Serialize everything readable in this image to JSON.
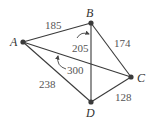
{
  "diagram": {
    "type": "weighted-graph",
    "vertices": [
      {
        "id": "A",
        "label": "A",
        "x": 23,
        "y": 42
      },
      {
        "id": "B",
        "label": "B",
        "x": 91,
        "y": 23
      },
      {
        "id": "C",
        "label": "C",
        "x": 131,
        "y": 77
      },
      {
        "id": "D",
        "label": "D",
        "x": 91,
        "y": 102
      }
    ],
    "edges": [
      {
        "from": "A",
        "to": "B",
        "weight": "185"
      },
      {
        "from": "B",
        "to": "C",
        "weight": "174"
      },
      {
        "from": "C",
        "to": "D",
        "weight": "128"
      },
      {
        "from": "A",
        "to": "D",
        "weight": "238"
      },
      {
        "from": "B",
        "to": "D",
        "weight": "205"
      },
      {
        "from": "A",
        "to": "C",
        "weight": "300"
      }
    ]
  }
}
